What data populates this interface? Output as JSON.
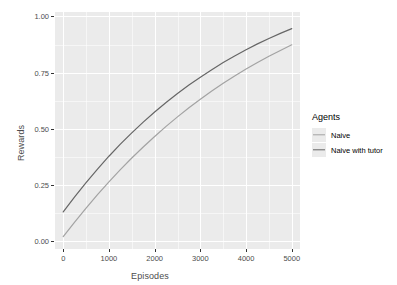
{
  "chart_data": {
    "type": "line",
    "title": "",
    "xlabel": "Episodes",
    "ylabel": "Rewards",
    "xlim": [
      -180,
      5180
    ],
    "ylim": [
      -0.035,
      1.02
    ],
    "xticks": [
      0,
      1000,
      2000,
      3000,
      4000,
      5000
    ],
    "xtick_labels": [
      "0",
      "1000",
      "2000",
      "3000",
      "4000",
      "5000"
    ],
    "yticks": [
      0.0,
      0.25,
      0.5,
      0.75,
      1.0
    ],
    "ytick_labels": [
      "0.00",
      "0.25",
      "0.50",
      "0.75",
      "1.00"
    ],
    "x_minor_ticks": [
      500,
      1500,
      2500,
      3500,
      4500
    ],
    "y_minor_ticks": [
      0.125,
      0.375,
      0.625,
      0.875
    ],
    "grid": true,
    "legend": {
      "title": "Agents",
      "position": "right",
      "entries": [
        {
          "label": "Naive",
          "color": "#a3a3a3"
        },
        {
          "label": "Naive with tutor",
          "color": "#666666"
        }
      ]
    },
    "panel_background": "#ebebeb",
    "grid_color": "#ffffff",
    "x": [
      0,
      250,
      500,
      750,
      1000,
      1250,
      1500,
      1750,
      2000,
      2250,
      2500,
      2750,
      3000,
      3250,
      3500,
      3750,
      4000,
      4250,
      4500,
      4750,
      5000
    ],
    "series": [
      {
        "name": "Naive",
        "color": "#a3a3a3",
        "values": [
          0.02,
          0.085,
          0.147,
          0.207,
          0.264,
          0.318,
          0.37,
          0.419,
          0.466,
          0.511,
          0.553,
          0.594,
          0.632,
          0.668,
          0.703,
          0.735,
          0.766,
          0.795,
          0.823,
          0.849,
          0.874
        ]
      },
      {
        "name": "Naive with tutor",
        "color": "#666666",
        "values": [
          0.13,
          0.197,
          0.261,
          0.321,
          0.378,
          0.432,
          0.482,
          0.53,
          0.575,
          0.617,
          0.657,
          0.695,
          0.73,
          0.763,
          0.795,
          0.824,
          0.852,
          0.878,
          0.902,
          0.925,
          0.946
        ]
      }
    ]
  }
}
